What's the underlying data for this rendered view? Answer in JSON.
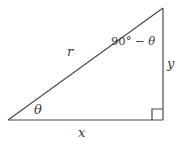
{
  "figure": {
    "background_color": "#ffffff",
    "stroke_color": "#4a4a4a",
    "text_color": "#3a3a3a",
    "labels": {
      "hypotenuse": "r",
      "base": "x",
      "vertical": "y",
      "angle_lower_left": "θ",
      "angle_top_degrees": "90° − ",
      "angle_top_variable": "θ",
      "angle_top_full": "90° − θ"
    },
    "geometry": {
      "vertex_left": [
        8,
        120
      ],
      "vertex_bottom_right": [
        163,
        120
      ],
      "vertex_top_right": [
        163,
        8
      ],
      "right_angle_marker_size": 11,
      "right_angle_marker_origin": [
        152,
        109
      ]
    }
  }
}
